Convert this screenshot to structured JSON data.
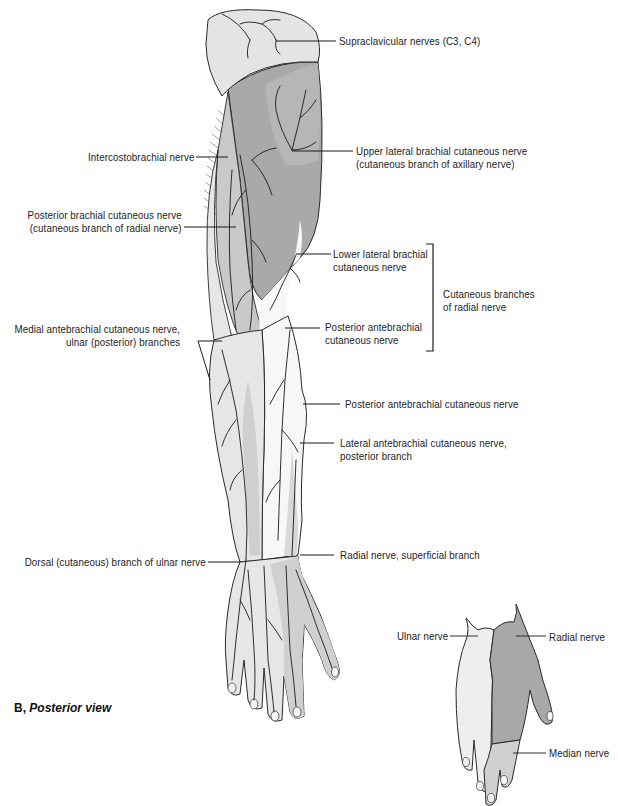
{
  "figure": {
    "caption_letter": "B,",
    "caption_text": "Posterior view",
    "colors": {
      "light_zone": "#e6e6e6",
      "mid_zone": "#c9c9c9",
      "dark_zone": "#a9a9a9",
      "white_zone": "#f7f7f7",
      "outline": "#2a2a2a",
      "nerve": "#1a1a1a"
    }
  },
  "main_arm": {
    "labels_right": [
      {
        "id": "supraclavicular",
        "lines": [
          "Supraclavicular nerves (C3, C4)"
        ]
      },
      {
        "id": "upper-lateral-brachial",
        "lines": [
          "Upper lateral brachial cutaneous nerve",
          "(cutaneous branch of axillary nerve)"
        ]
      },
      {
        "id": "lower-lateral-brachial",
        "lines": [
          "Lower lateral brachial",
          "cutaneous nerve"
        ]
      },
      {
        "id": "posterior-antebrachial-upper",
        "lines": [
          "Posterior antebrachial",
          "cutaneous nerve"
        ]
      },
      {
        "id": "posterior-antebrachial",
        "lines": [
          "Posterior antebrachial cutaneous nerve"
        ]
      },
      {
        "id": "lateral-antebrachial",
        "lines": [
          "Lateral antebrachial cutaneous nerve,",
          "posterior branch"
        ]
      },
      {
        "id": "radial-superficial",
        "lines": [
          "Radial nerve, superficial branch"
        ]
      }
    ],
    "labels_left": [
      {
        "id": "intercostobrachial",
        "lines": [
          "Intercostobrachial nerve"
        ]
      },
      {
        "id": "posterior-brachial",
        "lines": [
          "Posterior brachial cutaneous nerve",
          "(cutaneous branch of radial nerve)"
        ]
      },
      {
        "id": "medial-antebrachial",
        "lines": [
          "Medial antebrachial cutaneous nerve,",
          "ulnar (posterior) branches"
        ]
      },
      {
        "id": "dorsal-ulnar",
        "lines": [
          "Dorsal (cutaneous) branch of ulnar nerve"
        ]
      }
    ],
    "bracket_group": {
      "lines": [
        "Cutaneous branches",
        "of radial nerve"
      ]
    }
  },
  "inset_hand": {
    "labels": [
      {
        "id": "ulnar",
        "lines": [
          "Ulnar nerve"
        ]
      },
      {
        "id": "radial",
        "lines": [
          "Radial nerve"
        ]
      },
      {
        "id": "median",
        "lines": [
          "Median nerve"
        ]
      }
    ]
  }
}
